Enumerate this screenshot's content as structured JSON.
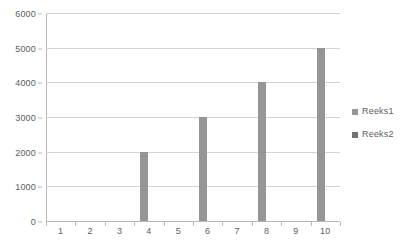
{
  "chart_data": {
    "type": "bar",
    "title": "",
    "subtitle": "",
    "xlabel": "",
    "ylabel": "",
    "categories": [
      "1",
      "2",
      "3",
      "4",
      "5",
      "6",
      "7",
      "8",
      "9",
      "10"
    ],
    "series": [
      {
        "name": "Reeks1",
        "color": "#969696",
        "values": [
          0,
          0,
          0,
          2000,
          0,
          3000,
          0,
          4000,
          0,
          5000
        ]
      },
      {
        "name": "Reeks2",
        "color": "#727272",
        "values": [
          0,
          0,
          0,
          0,
          0,
          0,
          0,
          0,
          0,
          0
        ]
      }
    ],
    "ylim": [
      0,
      6000
    ],
    "yticks": [
      0,
      1000,
      2000,
      3000,
      4000,
      5000,
      6000
    ],
    "ytick_labels": [
      "0",
      "1000",
      "2000",
      "3000",
      "4000",
      "5000",
      "6000"
    ],
    "grid": true,
    "grid_axis": "y",
    "legend_position": "right",
    "legend": [
      "Reeks1",
      "Reeks2"
    ],
    "background_color": "#ffffff",
    "axis_color": "#b8b8b8",
    "gridline_color": "#d4d4d4",
    "text_color": "#5e5e5e"
  }
}
